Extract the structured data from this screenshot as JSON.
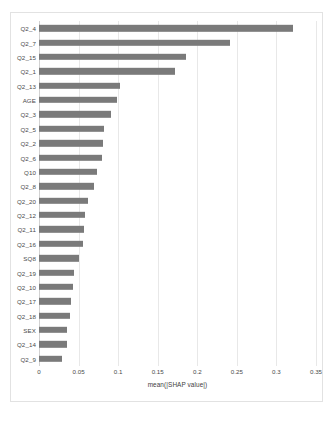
{
  "chart_data": {
    "type": "bar",
    "orientation": "horizontal",
    "title": "",
    "xlabel": "mean(|SHAP value|)",
    "ylabel": "",
    "xlim": [
      0,
      0.35
    ],
    "xticks": [
      "0",
      "0.05",
      "0.1",
      "0.15",
      "0.2",
      "0.25",
      "0.3",
      "0.35"
    ],
    "xtick_values": [
      0,
      0.05,
      0.1,
      0.15,
      0.2,
      0.25,
      0.3,
      0.35
    ],
    "grid": true,
    "legend": "none",
    "bar_color": "#7a7a7a",
    "categories": [
      "Q2_4",
      "Q2_7",
      "Q2_15",
      "Q2_1",
      "Q2_13",
      "AGE",
      "Q2_3",
      "Q2_5",
      "Q2_2",
      "Q2_6",
      "Q10",
      "Q2_8",
      "Q2_20",
      "Q2_12",
      "Q2_11",
      "Q2_16",
      "SQ8",
      "Q2_19",
      "Q2_10",
      "Q2_17",
      "Q2_18",
      "SEX",
      "Q2_14",
      "Q2_9"
    ],
    "values": [
      0.321,
      0.241,
      0.186,
      0.172,
      0.102,
      0.098,
      0.091,
      0.082,
      0.081,
      0.079,
      0.073,
      0.069,
      0.062,
      0.058,
      0.057,
      0.056,
      0.051,
      0.044,
      0.043,
      0.04,
      0.039,
      0.036,
      0.035,
      0.029
    ]
  }
}
